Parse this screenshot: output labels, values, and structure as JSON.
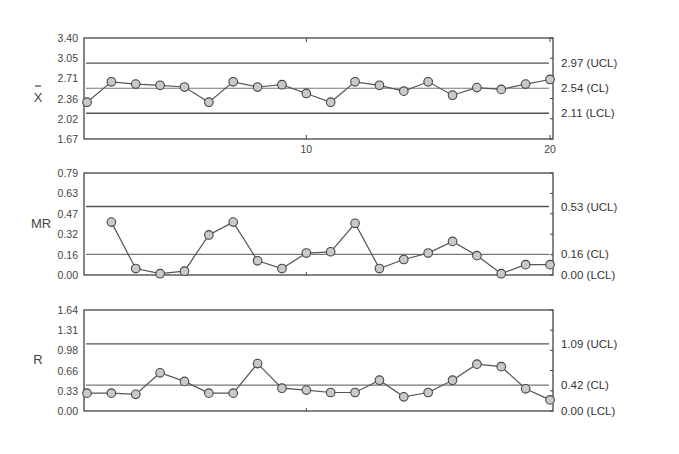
{
  "chart_data": [
    {
      "type": "line",
      "title": "X-bar chart",
      "ylabel": "X̄",
      "x": [
        1,
        2,
        3,
        4,
        5,
        6,
        7,
        8,
        9,
        10,
        11,
        12,
        13,
        14,
        15,
        16,
        17,
        18,
        19,
        20
      ],
      "xticks": [
        10,
        20
      ],
      "yticks": [
        "1.67",
        "2.02",
        "2.36",
        "2.71",
        "3.05",
        "3.40"
      ],
      "ylim": [
        1.67,
        3.4
      ],
      "values": [
        2.3,
        2.65,
        2.61,
        2.59,
        2.56,
        2.3,
        2.65,
        2.56,
        2.6,
        2.45,
        2.3,
        2.65,
        2.59,
        2.49,
        2.65,
        2.42,
        2.55,
        2.52,
        2.61,
        2.69
      ],
      "limits": {
        "UCL": 2.97,
        "CL": 2.54,
        "LCL": 2.11
      },
      "limit_labels": [
        "2.97 (UCL)",
        "2.54 (CL)",
        "2.11 (LCL)"
      ]
    },
    {
      "type": "line",
      "title": "Moving Range chart",
      "ylabel": "MR",
      "x": [
        1,
        2,
        3,
        4,
        5,
        6,
        7,
        8,
        9,
        10,
        11,
        12,
        13,
        14,
        15,
        16,
        17,
        18,
        19,
        20
      ],
      "yticks": [
        "0.00",
        "0.16",
        "0.32",
        "0.47",
        "0.63",
        "0.79"
      ],
      "ylim": [
        0.0,
        0.79
      ],
      "values": [
        null,
        0.41,
        0.05,
        0.01,
        0.03,
        0.31,
        0.41,
        0.11,
        0.05,
        0.17,
        0.18,
        0.4,
        0.05,
        0.12,
        0.17,
        0.26,
        0.15,
        0.01,
        0.08,
        0.08
      ],
      "limits": {
        "UCL": 0.53,
        "CL": 0.16,
        "LCL": 0.0
      },
      "limit_labels": [
        "0.53 (UCL)",
        "0.16 (CL)",
        "0.00 (LCL)"
      ]
    },
    {
      "type": "line",
      "title": "Range chart",
      "ylabel": "R",
      "x": [
        1,
        2,
        3,
        4,
        5,
        6,
        7,
        8,
        9,
        10,
        11,
        12,
        13,
        14,
        15,
        16,
        17,
        18,
        19,
        20
      ],
      "yticks": [
        "0.00",
        "0.33",
        "0.66",
        "0.98",
        "1.31",
        "1.64"
      ],
      "ylim": [
        0.0,
        1.64
      ],
      "values": [
        0.29,
        0.29,
        0.27,
        0.62,
        0.48,
        0.29,
        0.29,
        0.77,
        0.37,
        0.34,
        0.3,
        0.3,
        0.5,
        0.23,
        0.3,
        0.5,
        0.76,
        0.72,
        0.36,
        0.18
      ],
      "limits": {
        "UCL": 1.09,
        "CL": 0.42,
        "LCL": 0.0
      },
      "limit_labels": [
        "1.09 (UCL)",
        "0.42 (CL)",
        "0.00 (LCL)"
      ]
    }
  ],
  "layout": {
    "plot_left": 84,
    "plot_right": 553,
    "panels": [
      {
        "top": 38,
        "bottom": 139,
        "show_xticks": true
      },
      {
        "top": 173,
        "bottom": 275,
        "show_xticks": false
      },
      {
        "top": 310,
        "bottom": 411,
        "show_xticks": false
      }
    ]
  }
}
